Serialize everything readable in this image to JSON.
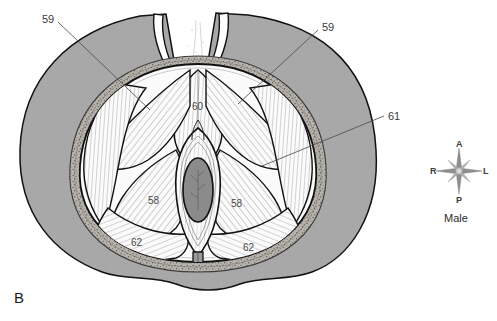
{
  "figure": {
    "panel_letter": "B",
    "subject": "Male"
  },
  "callouts": [
    {
      "id": "callout-59-left",
      "text": "59",
      "x": 42,
      "y": 14
    },
    {
      "id": "callout-59-right",
      "text": "59",
      "x": 322,
      "y": 22
    },
    {
      "id": "callout-61",
      "text": "61",
      "x": 388,
      "y": 111
    }
  ],
  "inner_labels": [
    {
      "id": "inner-60",
      "text": "60",
      "x": 192,
      "y": 102
    },
    {
      "id": "inner-58-left",
      "text": "58",
      "x": 148,
      "y": 196
    },
    {
      "id": "inner-58-right",
      "text": "58",
      "x": 231,
      "y": 199
    },
    {
      "id": "inner-62-left",
      "text": "62",
      "x": 131,
      "y": 238
    },
    {
      "id": "inner-62-right",
      "text": "62",
      "x": 243,
      "y": 243
    }
  ],
  "compass": {
    "anterior": "A",
    "posterior": "P",
    "right": "R",
    "left": "L",
    "caption": "Male"
  },
  "colors": {
    "background": "#ffffff",
    "skin_gray": "#a8a8a8",
    "skin_gray_dark": "#9a9a9a",
    "fat_band": "#b4b0aa",
    "muscle_white": "#fbfbfb",
    "orifice_gray": "#8a8a8a",
    "outline": "#121212",
    "leader_line": "#555555",
    "hatch": "#4a4a4a",
    "text": "#2b2b2b"
  }
}
